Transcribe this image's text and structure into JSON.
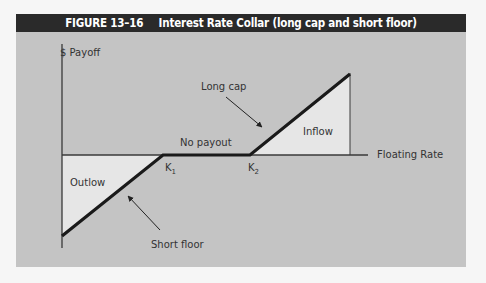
{
  "figure": {
    "number": "FIGURE 13–16",
    "title": "Interest Rate Collar (long cap and short floor)"
  },
  "chart_data": {
    "type": "line",
    "title": "Interest Rate Collar (long cap and short floor)",
    "xlabel": "Floating Rate",
    "ylabel": "$ Payoff",
    "strikes": [
      {
        "name": "K",
        "sub": "1"
      },
      {
        "name": "K",
        "sub": "2"
      }
    ],
    "payoff_profile": [
      {
        "x": 0,
        "y": -1
      },
      {
        "x": 1,
        "y": 0
      },
      {
        "x": 2,
        "y": 0
      },
      {
        "x": 3,
        "y": 1
      }
    ],
    "regions": {
      "outflow": "Outlow",
      "no_payout": "No payout",
      "inflow": "Inflow"
    },
    "annotations": {
      "long_cap": "Long cap",
      "short_floor": "Short floor"
    },
    "colors": {
      "background": "#c4c4c4",
      "title_bar": "#2a2a2a",
      "region_fill": "#e6e6e6",
      "payoff_line": "#1a1a1a"
    }
  }
}
